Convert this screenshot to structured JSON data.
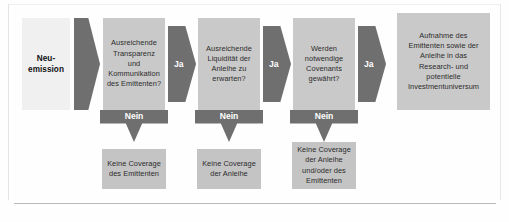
{
  "diagram": {
    "colors": {
      "box_fill": "#c9c9c9",
      "start_fill": "#f0f0f0",
      "arrow_fill": "#6f6f6f",
      "text": "#2b2b2b",
      "arrow_text": "#ffffff",
      "background": "#fefefe",
      "rule": "#b9b9b9"
    },
    "start": {
      "label": "Neu-\nemission"
    },
    "decisions": [
      {
        "id": "transparenz",
        "label": "Ausreichende\nTransparenz und\nKommunikation\ndes Emittenten?",
        "yes_label": "Ja",
        "no_label": "Nein",
        "no_outcome": "Keine Coverage\ndes Emittenten"
      },
      {
        "id": "liquiditaet",
        "label": "Ausreichende\nLiquidität der\nAnleihe zu\nerwarten?",
        "yes_label": "Ja",
        "no_label": "Nein",
        "no_outcome": "Keine Coverage\nder Anleihe"
      },
      {
        "id": "covenants",
        "label": "Werden\nnotwendige\nCovenants\ngewährt?",
        "yes_label": "Ja",
        "no_label": "Nein",
        "no_outcome": "Keine Coverage\nder Anleihe\nund/oder des\nEmittenten"
      }
    ],
    "result": {
      "label": "Aufnahme des\nEmittenten sowie der\nAnleihe in das\nResearch- und\npotentielle\nInvestmentuniversum"
    }
  }
}
